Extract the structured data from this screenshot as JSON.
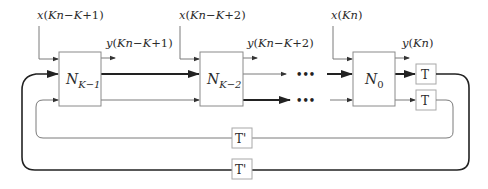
{
  "diagram": {
    "type": "block-diagram",
    "nodes": [
      {
        "id": "nk1",
        "label_main": "N",
        "label_sub": "K−1",
        "input": "x(Kn−K+1)",
        "output": "y(Kn−K+1)"
      },
      {
        "id": "nk2",
        "label_main": "N",
        "label_sub": "K−2",
        "input": "x(Kn−K+2)",
        "output": "y(Kn−K+2)"
      },
      {
        "id": "n0",
        "label_main": "N",
        "label_sub": "0",
        "input": "x(Kn)",
        "output": "y(Kn)"
      }
    ],
    "delays": {
      "t_top": "T",
      "t_bottom": "T",
      "tprime_inner": "T'",
      "tprime_outer": "T'"
    },
    "ellipsis": "•••",
    "labels": {
      "x1": "x(Kn−K+1)",
      "y1": "y(Kn−K+1)",
      "x2": "x(Kn−K+2)",
      "y2": "y(Kn−K+2)",
      "x0": "x(Kn)",
      "y0": "y(Kn)"
    },
    "colors": {
      "thick_line": "#222222",
      "thin_line": "#7a7a7a",
      "box_border": "#8a8a8a"
    }
  }
}
